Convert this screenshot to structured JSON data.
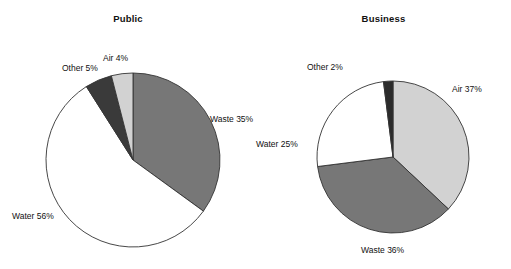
{
  "figure": {
    "width": 511,
    "height": 269,
    "background": "#ffffff"
  },
  "chart_data": [
    {
      "type": "pie",
      "title": "Public",
      "categories": [
        "Waste",
        "Water",
        "Other",
        "Air"
      ],
      "values": [
        35,
        56,
        5,
        4
      ],
      "unit": "%",
      "labels": [
        "Waste 35%",
        "Water 56%",
        "Other 5%",
        "Air 4%"
      ],
      "colors": [
        "#777777",
        "#ffffff",
        "#3a3a3a",
        "#d2d2d2"
      ],
      "start_angle_deg": 0,
      "direction": "clockwise",
      "legend": "none",
      "grid": false,
      "center": {
        "x": 133,
        "y": 160
      },
      "radius": 87
    },
    {
      "type": "pie",
      "title": "Business",
      "categories": [
        "Air",
        "Waste",
        "Water",
        "Other"
      ],
      "values": [
        37,
        36,
        25,
        2
      ],
      "unit": "%",
      "labels": [
        "Air 37%",
        "Waste 36%",
        "Water 25%",
        "Other 2%"
      ],
      "colors": [
        "#d2d2d2",
        "#777777",
        "#ffffff",
        "#2b2b2b"
      ],
      "start_angle_deg": 0,
      "direction": "clockwise",
      "legend": "none",
      "grid": false,
      "center": {
        "x": 137,
        "y": 157
      },
      "radius": 76
    }
  ],
  "public_chart": {
    "title": "Public",
    "labels": {
      "other": "Other 5%",
      "air": "Air 4%",
      "waste": "Waste 35%",
      "water": "Water 56%"
    }
  },
  "business_chart": {
    "title": "Business",
    "labels": {
      "other": "Other 2%",
      "air": "Air 37%",
      "water": "Water 25%",
      "waste": "Waste 36%"
    }
  },
  "colors": {
    "slice_waste": "#777777",
    "slice_water": "#ffffff",
    "slice_other_public": "#3a3a3a",
    "slice_other_business": "#2b2b2b",
    "slice_air": "#d2d2d2",
    "outline": "#333333",
    "text": "#111111"
  }
}
